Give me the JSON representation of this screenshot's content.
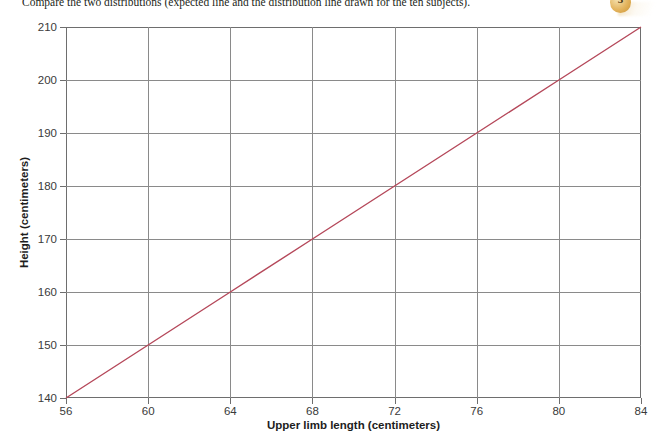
{
  "caption": {
    "text": "Compare the two distributions (expected line and the distribution line drawn for the ten subjects).",
    "step_number": "3"
  },
  "chart_data": {
    "type": "line",
    "title": "",
    "xlabel": "Upper limb length (centimeters)",
    "ylabel": "Height (centimeters)",
    "xlim": [
      56,
      84
    ],
    "ylim": [
      140,
      210
    ],
    "xticks": [
      56,
      60,
      64,
      68,
      72,
      76,
      80,
      84
    ],
    "yticks": [
      140,
      150,
      160,
      170,
      180,
      190,
      200,
      210
    ],
    "grid": true,
    "legend": "none",
    "series": [
      {
        "name": "expected line",
        "color": "#b5485a",
        "x": [
          56,
          84
        ],
        "values": [
          140,
          210
        ],
        "points": [
          {
            "x": 56,
            "y": 140
          },
          {
            "x": 60,
            "y": 150
          },
          {
            "x": 64,
            "y": 160
          },
          {
            "x": 68,
            "y": 170
          },
          {
            "x": 72,
            "y": 180
          },
          {
            "x": 76,
            "y": 190
          },
          {
            "x": 80,
            "y": 200
          },
          {
            "x": 84,
            "y": 210
          }
        ]
      }
    ]
  },
  "colors": {
    "line": "#b5485a",
    "axis": "#6e6e6e",
    "grid": "#8a8a8a",
    "badge": "#e3b35c"
  }
}
